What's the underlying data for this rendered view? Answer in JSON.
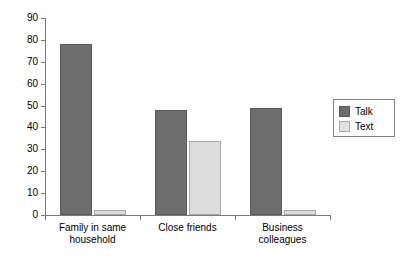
{
  "chart_data": {
    "type": "bar",
    "title": "",
    "subtitle": "",
    "xlabel": "",
    "ylabel": "",
    "ylim": [
      0,
      90
    ],
    "yticks": [
      0,
      10,
      20,
      30,
      40,
      50,
      60,
      70,
      80,
      90
    ],
    "ytick_labels": [
      "0",
      "10",
      "20",
      "30",
      "40",
      "50",
      "60",
      "70",
      "80",
      "90"
    ],
    "grid": false,
    "legend_position": "right",
    "categories": [
      "Family in same household",
      "Close friends",
      "Business colleagues"
    ],
    "category_lines": [
      [
        "Family in same",
        "household"
      ],
      [
        "Close friends",
        ""
      ],
      [
        "Business",
        "colleagues"
      ]
    ],
    "series": [
      {
        "name": "Talk",
        "color": "#6e6e6e",
        "values": [
          78,
          48,
          49
        ]
      },
      {
        "name": "Text",
        "color": "#dcdcdc",
        "values": [
          2.5,
          34,
          2.5
        ]
      }
    ]
  },
  "legend": {
    "entries": [
      {
        "label": "Talk",
        "swatch": "talk"
      },
      {
        "label": "Text",
        "swatch": "text"
      }
    ]
  },
  "colors": {
    "talk": "#6e6e6e",
    "text": "#dcdcdc",
    "axis": "#7a7a7a",
    "background": "#ffffff"
  }
}
